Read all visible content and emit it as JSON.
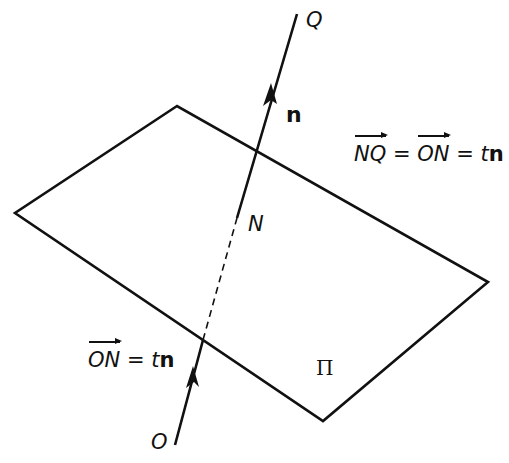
{
  "diagram": {
    "plane": {
      "label": "Π",
      "corners": [
        [
          177,
          106
        ],
        [
          15,
          213
        ],
        [
          323,
          421
        ],
        [
          488,
          282
        ]
      ]
    },
    "line": {
      "start": [
        175,
        445
      ],
      "end": [
        297,
        14
      ],
      "intersection": [
        237,
        218
      ],
      "dashed_segment": [
        [
          237,
          218
        ],
        [
          203,
          340
        ]
      ]
    },
    "points": {
      "O": "O",
      "N": "N",
      "Q": "Q"
    },
    "vector_label": "n",
    "equations": {
      "top": {
        "lhs_vec": "NQ",
        "eq1": "=",
        "mid_vec": "ON",
        "eq2": "=",
        "t": "t",
        "n": "n"
      },
      "bottom": {
        "lhs_vec": "ON",
        "eq": "=",
        "t": "t",
        "n": "n"
      }
    },
    "colors": {
      "ink": "#111111",
      "background": "#ffffff"
    }
  }
}
